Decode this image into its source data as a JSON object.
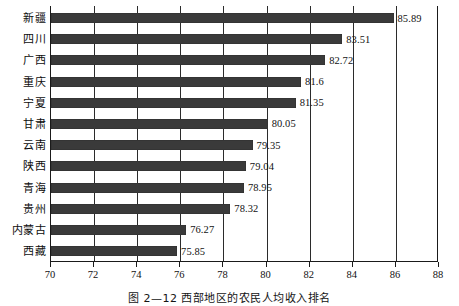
{
  "chart_data": {
    "type": "bar",
    "orientation": "horizontal",
    "title": "",
    "xlabel": "",
    "ylabel": "",
    "xlim": [
      70,
      88
    ],
    "xticks": [
      70,
      72,
      74,
      76,
      78,
      80,
      82,
      84,
      86,
      88
    ],
    "xtick_labels": [
      "70",
      "72",
      "74",
      "76",
      "78",
      "80",
      "82",
      "84",
      "86",
      "88"
    ],
    "grid": true,
    "grid_axis": "x",
    "legend": false,
    "bar_color": "#3a3a3a",
    "categories": [
      "新疆",
      "四川",
      "广西",
      "重庆",
      "宁夏",
      "甘肃",
      "云南",
      "陕西",
      "青海",
      "贵州",
      "内蒙古",
      "西藏"
    ],
    "values": [
      85.89,
      83.51,
      82.72,
      81.6,
      81.35,
      80.05,
      79.35,
      79.04,
      78.95,
      78.32,
      76.27,
      75.85
    ],
    "value_labels": [
      "85.89",
      "83.51",
      "82.72",
      "81.6",
      "81.35",
      "80.05",
      "79.35",
      "79.04",
      "78.95",
      "78.32",
      "76.27",
      "75.85"
    ]
  },
  "caption": {
    "text": "图 2—12  西部地区的农民人均收入排名"
  }
}
